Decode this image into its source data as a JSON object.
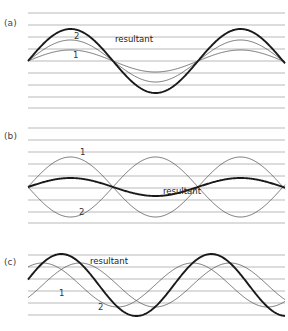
{
  "figure": {
    "type": "wave-superposition-diagram",
    "background": "#ffffff",
    "grid_color": "#9b9b9b",
    "thin_curve_color": "#4a4a4a",
    "bold_curve_color": "#1a1a1a",
    "panels": [
      {
        "id": "a",
        "label": "(a)",
        "description": "two waves in phase, resultant is their sum",
        "grid": {
          "x_start": 28,
          "x_end": 285,
          "y_values": [
            13,
            25,
            37,
            49,
            61,
            73,
            85,
            97,
            108
          ],
          "count": 9
        },
        "axis_y": 61,
        "x_domain": [
          28,
          285
        ],
        "period": 170,
        "labels": [
          {
            "name": "wave-1",
            "text": "1",
            "x": 73,
            "y": 58
          },
          {
            "name": "wave-2",
            "text": "2",
            "x": 74,
            "y": 39
          },
          {
            "name": "resultant",
            "text": "resultant",
            "x": 115,
            "y": 42
          }
        ],
        "curves": [
          {
            "name": "wave-1",
            "amplitude": 11,
            "phase_deg": 0,
            "weight": "thin"
          },
          {
            "name": "wave-2",
            "amplitude": 21,
            "phase_deg": 0,
            "weight": "thin"
          },
          {
            "name": "resultant",
            "amplitude": 32,
            "phase_deg": 0,
            "weight": "bold"
          }
        ]
      },
      {
        "id": "b",
        "label": "(b)",
        "description": "two waves out of phase, resultant is their small difference",
        "grid": {
          "x_start": 28,
          "x_end": 285,
          "y_values": [
            13,
            25,
            37,
            49,
            61,
            73,
            85,
            97,
            108
          ],
          "count": 9
        },
        "axis_y": 72,
        "x_domain": [
          28,
          285
        ],
        "period": 170,
        "labels": [
          {
            "name": "wave-1",
            "text": "1",
            "x": 80,
            "y": 40
          },
          {
            "name": "wave-2",
            "text": "2",
            "x": 79,
            "y": 100
          },
          {
            "name": "resultant",
            "text": "resultant",
            "x": 163,
            "y": 79
          }
        ],
        "curves": [
          {
            "name": "wave-1",
            "amplitude": 30,
            "phase_deg": 0,
            "weight": "thin"
          },
          {
            "name": "wave-2",
            "amplitude": 30,
            "phase_deg": 180,
            "weight": "thin"
          },
          {
            "name": "resultant",
            "amplitude": 9,
            "phase_deg": 0,
            "weight": "bold"
          }
        ]
      },
      {
        "id": "c",
        "label": "(c)",
        "description": "two waves with a phase difference, resultant is shifted in phase",
        "grid": {
          "x_start": 28,
          "x_end": 285,
          "y_values": [
            15,
            27,
            39,
            51,
            63,
            75
          ],
          "count": 6
        },
        "axis_y": 45,
        "x_domain": [
          28,
          285
        ],
        "period": 150,
        "labels": [
          {
            "name": "wave-1",
            "text": "1",
            "x": 59,
            "y": 56
          },
          {
            "name": "wave-2",
            "text": "2",
            "x": 98,
            "y": 70
          },
          {
            "name": "resultant",
            "text": "resultant",
            "x": 90,
            "y": 24
          }
        ],
        "curves": [
          {
            "name": "wave-1",
            "amplitude": 22,
            "phase_deg": 55,
            "weight": "thin"
          },
          {
            "name": "wave-2",
            "amplitude": 22,
            "phase_deg": -35,
            "weight": "thin"
          },
          {
            "name": "resultant",
            "amplitude": 31,
            "phase_deg": 10,
            "weight": "bold"
          }
        ]
      }
    ]
  }
}
